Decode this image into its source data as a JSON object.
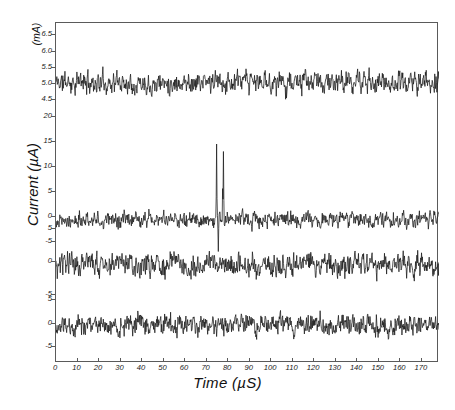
{
  "chart_data": {
    "type": "line",
    "title": "",
    "xlabel": "Time (µS)",
    "ylabel": "Current (µA)",
    "panel1_unit": "(mA)",
    "xlim": [
      0,
      178
    ],
    "grid": false,
    "legend": "none",
    "xticks": [
      0,
      10,
      20,
      30,
      40,
      50,
      60,
      70,
      80,
      90,
      100,
      110,
      120,
      130,
      140,
      150,
      160,
      170
    ],
    "xticklabels": [
      "0",
      "10",
      "20",
      "30",
      "40",
      "50",
      "60",
      "70",
      "80",
      "90",
      "100",
      "110",
      "120",
      "130",
      "140",
      "150",
      "160",
      "170"
    ],
    "panels": [
      {
        "name": "panel-1-excitation-current",
        "unit": "mA",
        "ylim": [
          4.35,
          6.7
        ],
        "yticks": [
          4.5,
          5.0,
          5.5,
          6.0,
          6.5
        ],
        "yticklabels": [
          "4.5",
          "5.0",
          "5.5",
          "6.0",
          "6.5"
        ],
        "baseline": 5.05,
        "noise_amplitude": 0.32,
        "seed": 11,
        "spikes": []
      },
      {
        "name": "panel-2-signal-with-spikes",
        "unit": "µA",
        "ylim": [
          -8.5,
          21.5
        ],
        "yticks": [
          -5,
          0,
          5,
          10,
          15,
          20
        ],
        "yticklabels": [
          "-5",
          "0",
          "5",
          "10",
          "15",
          "20"
        ],
        "baseline": -0.6,
        "noise_amplitude": 1.5,
        "seed": 27,
        "spikes": [
          {
            "t": 74.6,
            "value": 14.5
          },
          {
            "t": 75.4,
            "value": -7.0
          },
          {
            "t": 77.6,
            "value": 20.0
          },
          {
            "t": 77.9,
            "value": 13.0
          }
        ]
      },
      {
        "name": "panel-3-reference-trace",
        "unit": "µA",
        "ylim": [
          -7.5,
          6.5
        ],
        "yticks": [
          -5,
          0,
          5
        ],
        "yticklabels": [
          "-5",
          "0",
          "5"
        ],
        "baseline": -0.5,
        "noise_amplitude": 1.7,
        "seed": 43,
        "spikes": []
      },
      {
        "name": "panel-4-background-trace",
        "unit": "µA",
        "ylim": [
          -7.5,
          6.5
        ],
        "yticks": [
          -5,
          0,
          5
        ],
        "yticklabels": [
          "-5",
          "0",
          "5"
        ],
        "baseline": -0.3,
        "noise_amplitude": 2.1,
        "seed": 59,
        "spikes": []
      }
    ],
    "colors": {
      "trace": "#1a1a1a",
      "frame": "#5a5a5a",
      "background": "#ffffff"
    }
  }
}
